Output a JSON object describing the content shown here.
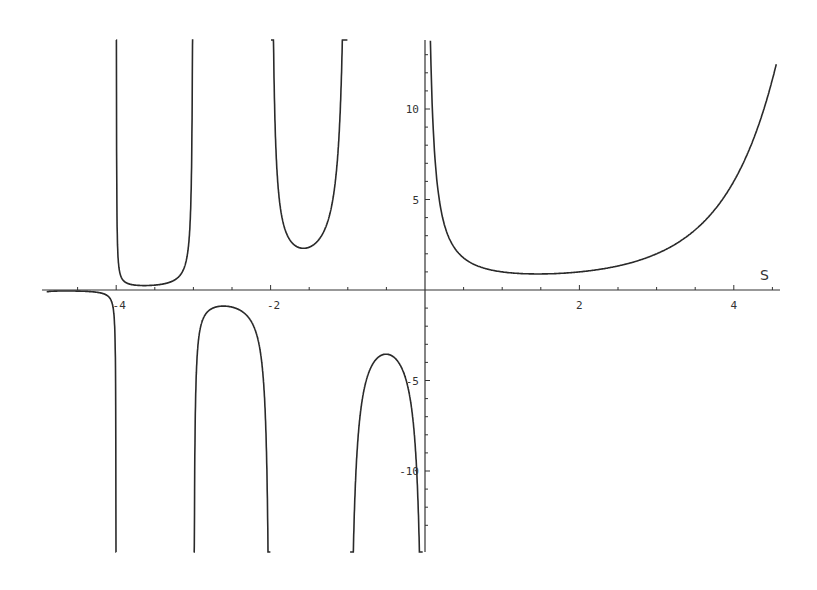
{
  "chart_data": {
    "type": "line",
    "title": "",
    "xlabel": "S",
    "ylabel": "",
    "function_description": "Gamma function Γ(s)",
    "xlim": [
      -4.9,
      4.6
    ],
    "ylim": [
      -14.5,
      14
    ],
    "grid": false,
    "legend": null,
    "x_ticks": [
      {
        "value": -4,
        "label": "-4"
      },
      {
        "value": -2,
        "label": "-2"
      },
      {
        "value": 2,
        "label": "2"
      },
      {
        "value": 4,
        "label": "4"
      }
    ],
    "x_minor_ticks": [
      -4.5,
      -3.5,
      -3,
      -2.5,
      -1.5,
      -1,
      -0.5,
      0.5,
      1,
      1.5,
      2.5,
      3,
      3.5,
      4.5
    ],
    "y_ticks": [
      {
        "value": 10,
        "label": "10"
      },
      {
        "value": 5,
        "label": "5"
      },
      {
        "value": -5,
        "label": "-5"
      },
      {
        "value": -10,
        "label": "-10"
      }
    ],
    "vertical_asymptotes": [
      0,
      -1,
      -2,
      -3,
      -4
    ],
    "series": [
      {
        "name": "branch s>0",
        "domain": [
          0.07,
          4.55
        ],
        "local_min": {
          "x": 1.46,
          "y": 0.886
        }
      },
      {
        "name": "branch (-1,0)",
        "domain": [
          -0.97,
          -0.03
        ],
        "local_max": {
          "x": -0.5,
          "y": -3.545
        }
      },
      {
        "name": "branch (-2,-1)",
        "domain": [
          -1.995,
          -1.005
        ],
        "local_min": {
          "x": -1.57,
          "y": 2.3
        }
      },
      {
        "name": "branch (-3,-2)",
        "domain": [
          -2.998,
          -2.002
        ],
        "local_max": {
          "x": -2.61,
          "y": -0.888
        }
      },
      {
        "name": "branch (-4,-3)",
        "domain": [
          -3.9995,
          -3.0005
        ],
        "local_min": {
          "x": -3.64,
          "y": 0.245
        }
      },
      {
        "name": "branch (<-4)",
        "domain": [
          -4.9,
          -4.0005
        ]
      }
    ],
    "sample_points": [
      {
        "x": 1,
        "y": 1
      },
      {
        "x": 2,
        "y": 1
      },
      {
        "x": 3,
        "y": 2
      },
      {
        "x": 4,
        "y": 6
      },
      {
        "x": 0.5,
        "y": 1.772
      },
      {
        "x": -0.5,
        "y": -3.545
      },
      {
        "x": -1.5,
        "y": 2.363
      },
      {
        "x": -2.5,
        "y": -0.945
      },
      {
        "x": -3.5,
        "y": 0.27
      },
      {
        "x": -4.5,
        "y": -0.06
      }
    ]
  },
  "layout": {
    "origin_px": [
      425,
      290
    ],
    "px_per_unit_x": 77.2,
    "px_per_unit_y": 18.1,
    "plot_top_px": 40,
    "plot_bottom_px": 552,
    "axis_left_px": 42,
    "axis_right_px": 780,
    "line_color": "#2a2a2a",
    "axis_color": "#333333"
  }
}
